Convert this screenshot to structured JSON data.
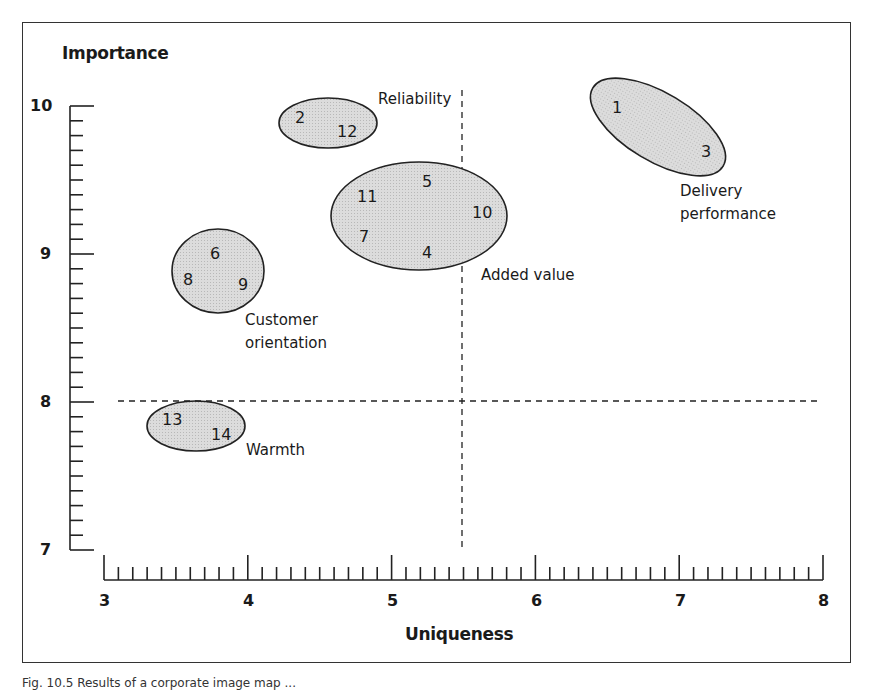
{
  "chart_data": {
    "type": "scatter",
    "title": "",
    "xlabel": "Uniqueness",
    "ylabel": "Importance",
    "xlim": [
      3,
      8
    ],
    "ylim": [
      7,
      10
    ],
    "x_ticks": [
      "3",
      "4",
      "5",
      "6",
      "7",
      "8"
    ],
    "y_ticks": [
      "7",
      "8",
      "9",
      "10"
    ],
    "minor_ticks_per_unit": 10,
    "grid": false,
    "reference_lines": [
      {
        "orientation": "vertical",
        "x": 5.5,
        "style": "dashed"
      },
      {
        "orientation": "horizontal",
        "y": 8.0,
        "style": "dashed"
      }
    ],
    "points": [
      {
        "label": "1",
        "x": 6.56,
        "y": 9.99
      },
      {
        "label": "2",
        "x": 4.36,
        "y": 9.92
      },
      {
        "label": "3",
        "x": 7.18,
        "y": 9.69
      },
      {
        "label": "4",
        "x": 5.24,
        "y": 9.01
      },
      {
        "label": "5",
        "x": 5.24,
        "y": 9.49
      },
      {
        "label": "6",
        "x": 3.77,
        "y": 9.0
      },
      {
        "label": "7",
        "x": 4.81,
        "y": 9.11
      },
      {
        "label": "8",
        "x": 3.58,
        "y": 8.82
      },
      {
        "label": "9",
        "x": 3.97,
        "y": 8.79
      },
      {
        "label": "10",
        "x": 5.63,
        "y": 9.28
      },
      {
        "label": "11",
        "x": 4.83,
        "y": 9.39
      },
      {
        "label": "12",
        "x": 4.69,
        "y": 9.82
      },
      {
        "label": "13",
        "x": 3.47,
        "y": 7.88
      },
      {
        "label": "14",
        "x": 3.81,
        "y": 7.78
      }
    ],
    "clusters": [
      {
        "name": "Reliability",
        "members": [
          "2",
          "12"
        ],
        "label_lines": [
          "Reliability"
        ]
      },
      {
        "name": "Added value",
        "members": [
          "4",
          "5",
          "7",
          "10",
          "11"
        ],
        "label_lines": [
          "Added value"
        ]
      },
      {
        "name": "Delivery performance",
        "members": [
          "1",
          "3"
        ],
        "label_lines": [
          "Delivery",
          "performance"
        ]
      },
      {
        "name": "Customer orientation",
        "members": [
          "6",
          "8",
          "9"
        ],
        "label_lines": [
          "Customer",
          "orientation"
        ]
      },
      {
        "name": "Warmth",
        "members": [
          "13",
          "14"
        ],
        "label_lines": [
          "Warmth"
        ]
      }
    ]
  },
  "labels": {
    "y_axis_title": "Importance",
    "x_axis_title": "Uniqueness",
    "reliability": "Reliability",
    "added_value": "Added value",
    "delivery_1": "Delivery",
    "delivery_2": "performance",
    "customer_1": "Customer",
    "customer_2": "orientation",
    "warmth": "Warmth"
  },
  "caption": "Fig. 10.5 Results of a corporate image map ..."
}
